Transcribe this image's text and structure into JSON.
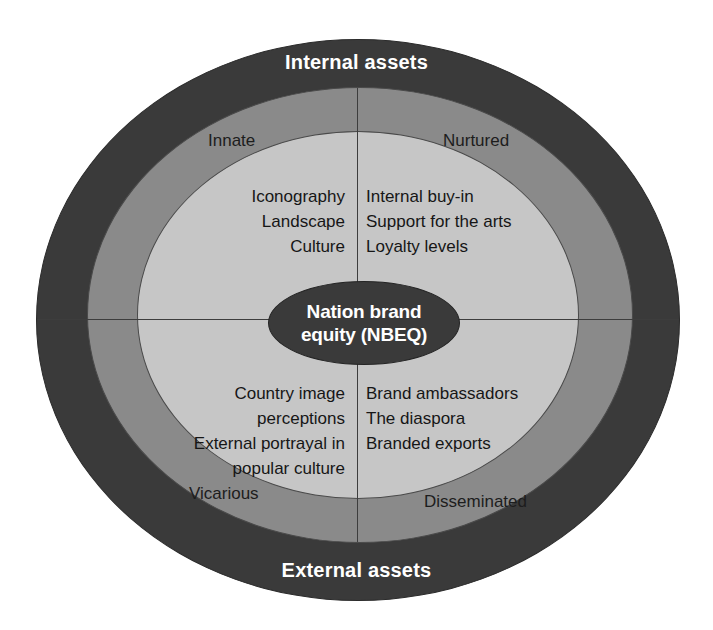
{
  "diagram": {
    "center": {
      "line1": "Nation brand",
      "line2": "equity (NBEQ)"
    },
    "banners": {
      "top": "Internal assets",
      "bottom": "External assets"
    },
    "quadrants": {
      "innate": {
        "label": "Innate",
        "items": [
          "Iconography",
          "Landscape",
          "Culture"
        ]
      },
      "nurtured": {
        "label": "Nurtured",
        "items": [
          "Internal buy-in",
          "Support for the arts",
          "Loyalty levels"
        ]
      },
      "vicarious": {
        "label": "Vicarious",
        "items": [
          "Country image",
          "perceptions",
          "External portrayal in",
          "popular culture"
        ]
      },
      "disseminated": {
        "label": "Disseminated",
        "items": [
          "Brand ambassadors",
          "The diaspora",
          "Branded exports"
        ]
      }
    },
    "colors": {
      "outer_ring": "#3a3a3a",
      "middle_ring": "#8a8a8a",
      "inner_ring": "#c6c6c6",
      "center_ellipse": "#3a3a3a",
      "banner_text": "#ffffff",
      "body_text": "#161616",
      "divider": "#3d3d3d",
      "background": "#ffffff"
    }
  }
}
